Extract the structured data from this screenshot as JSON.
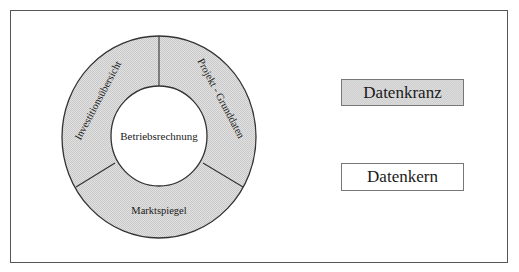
{
  "diagram": {
    "core": {
      "label": "Betriebsrechnung"
    },
    "ring": {
      "segments": [
        {
          "label": "Investitionsübersicht"
        },
        {
          "label": "Projekt - Grunddaten"
        },
        {
          "label": "Marktspiegel"
        }
      ]
    },
    "legend": {
      "items": [
        {
          "label": "Datenkranz",
          "style": "shaded"
        },
        {
          "label": "Datenkern",
          "style": "white"
        }
      ]
    },
    "colors": {
      "ring_fill": "#d9d9d9",
      "core_fill": "#ffffff",
      "stroke": "#333333"
    }
  }
}
